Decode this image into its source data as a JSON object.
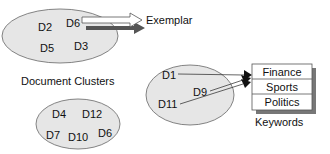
{
  "clusters": {
    "caption": "Document Clusters",
    "top": {
      "docs": [
        "D2",
        "D6",
        "D5",
        "D3"
      ]
    },
    "middle": {
      "docs": [
        "D1",
        "D9",
        "D11"
      ]
    },
    "bottom": {
      "docs": [
        "D4",
        "D12",
        "D7",
        "D10",
        "D6"
      ]
    }
  },
  "exemplar": {
    "label": "Exemplar"
  },
  "keywords": {
    "caption": "Keywords",
    "items": [
      "Finance",
      "Sports",
      "Politics"
    ]
  },
  "colors": {
    "cluster_fill": "#e6e6e6",
    "cluster_stroke": "#666666",
    "arrow_shadow": "#555555",
    "box_shadow": "#777777"
  }
}
